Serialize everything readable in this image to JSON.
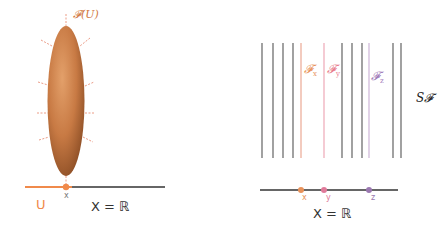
{
  "left_panel": {
    "sheaf_section_label": "𝓕(U)",
    "open_set_label": "U",
    "point_label": "x",
    "space_label": "X = ℝ",
    "colors": {
      "section": "#c8743a",
      "open_set": "#f08a4b",
      "axis": "#333333",
      "ticks": "#e8856a"
    }
  },
  "right_panel": {
    "stalk_labels": [
      {
        "text": "𝓕",
        "sub": "x",
        "color": "#e8925a"
      },
      {
        "text": "𝓕",
        "sub": "y",
        "color": "#e87a8a"
      },
      {
        "text": "𝓕",
        "sub": "z",
        "color": "#a07ab8"
      }
    ],
    "points": [
      {
        "label": "x",
        "color": "#e8925a"
      },
      {
        "label": "y",
        "color": "#e07a9a"
      },
      {
        "label": "z",
        "color": "#9a78b0"
      }
    ],
    "space_label": "X = ℝ",
    "etale_label": "S𝓕"
  }
}
